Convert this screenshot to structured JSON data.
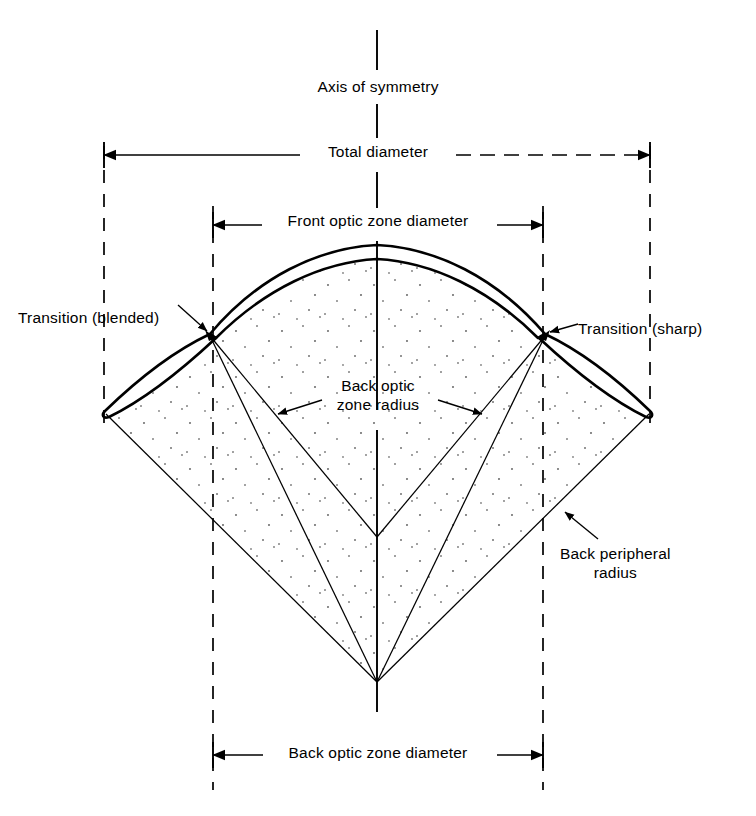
{
  "figure": {
    "kind": "technical-cross-section-diagram",
    "background_color": "#ffffff",
    "line_color": "#000000",
    "stipple_color": "#6b6b6b"
  },
  "labels": {
    "axis_of_symmetry": "Axis of symmetry",
    "total_diameter": "Total diameter",
    "front_optic_zone_diameter": "Front optic zone diameter",
    "transition_blended": "Transition (blended)",
    "transition_sharp": "Transition (sharp)",
    "back_optic_zone_radius_line1": "Back optic",
    "back_optic_zone_radius_line2": "zone radius",
    "back_peripheral_radius_line1": "Back peripheral",
    "back_peripheral_radius_line2": "radius",
    "back_optic_zone_diameter": "Back optic zone diameter"
  },
  "geometry": {
    "axis_x": 377,
    "dashed_verticals_x": [
      104,
      213,
      543,
      650
    ],
    "dimension_rows_y": {
      "total_diameter": 155,
      "front_optic_zone_diameter": 225,
      "back_optic_zone_diameter": 755
    },
    "radius_centers": {
      "back_optic_zone": [
        377,
        537
      ],
      "back_peripheral": [
        377,
        682
      ]
    },
    "transition_points": [
      [
        210,
        334
      ],
      [
        545,
        334
      ]
    ],
    "lens_edge_tips": [
      [
        105,
        412
      ],
      [
        650,
        412
      ]
    ]
  }
}
